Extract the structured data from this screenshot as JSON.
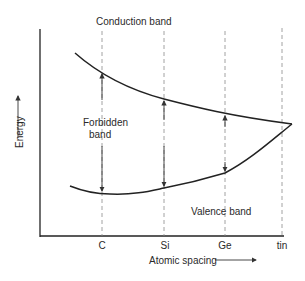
{
  "diagram": {
    "labels": {
      "conduction_band": "Conduction band",
      "forbidden_band_line1": "Forbidden",
      "forbidden_band_line2": "band",
      "valence_band": "Valence band"
    },
    "axes": {
      "x_label": "Atomic spacing",
      "y_label": "Energy",
      "x_ticks": [
        "C",
        "Si",
        "Ge",
        "tin"
      ]
    },
    "colors": {
      "line": "#222222",
      "dashed": "#8a8a8a",
      "text": "#2a2a2a"
    }
  }
}
